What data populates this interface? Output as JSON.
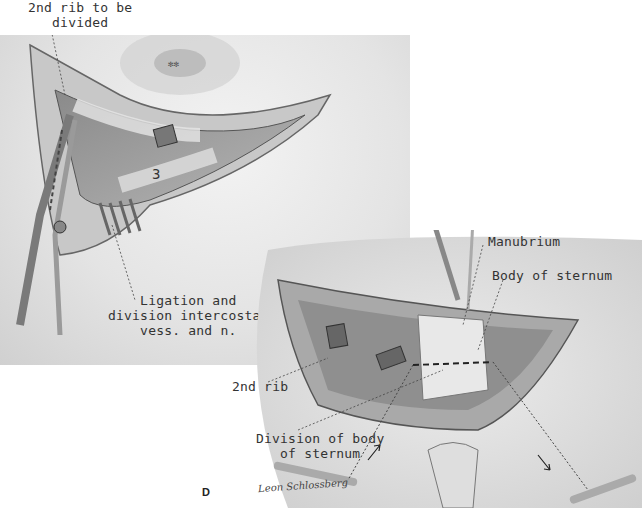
{
  "figure": {
    "letter": "D",
    "signature": "Leon Schlossberg",
    "panels": [
      {
        "id": "top",
        "region_number": "3",
        "labels": [
          {
            "lines": [
              "2nd rib to be",
              "divided"
            ]
          },
          {
            "lines": [
              "Ligation and",
              "division intercostal",
              "vess. and n."
            ]
          }
        ]
      },
      {
        "id": "bottom",
        "labels": [
          {
            "lines": [
              "Manubrium"
            ]
          },
          {
            "lines": [
              "Body of sternum"
            ]
          },
          {
            "lines": [
              "2nd rib"
            ]
          },
          {
            "lines": [
              "Division of body",
              "of sternum"
            ]
          }
        ]
      }
    ]
  },
  "colors": {
    "background": "#ffffff",
    "skin": "#e2e2e2",
    "tissue": "#9a9a9a",
    "ink": "#333333"
  }
}
